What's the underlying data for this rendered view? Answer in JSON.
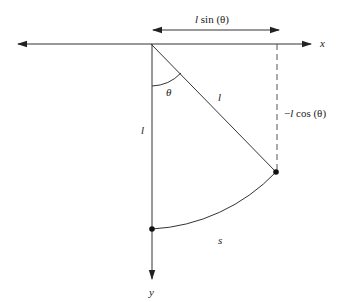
{
  "diagram": {
    "type": "pendulum-geometry",
    "labels": {
      "x_axis": "x",
      "y_axis": "y",
      "horizontal_displacement": "l sin (θ)",
      "horizontal_displacement_l": "l",
      "horizontal_displacement_rest": " sin (θ)",
      "vertical_displacement_prefix": "−",
      "vertical_displacement_l": "l",
      "vertical_displacement_rest": " cos (θ)",
      "angle": "θ",
      "rod_length_diagonal": "l",
      "rod_length_vertical": "l",
      "arc_length": "s"
    },
    "colors": {
      "stroke": "#333333",
      "point": "#111111",
      "background": "#ffffff"
    },
    "geometry": {
      "pivot": [
        151,
        44
      ],
      "rest_point": [
        152,
        229
      ],
      "displaced_point": [
        276,
        172
      ],
      "x_axis_range": [
        16,
        312
      ],
      "y_axis_end": 280
    }
  }
}
